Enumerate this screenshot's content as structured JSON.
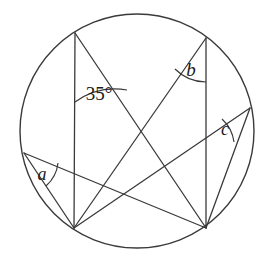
{
  "figure": {
    "type": "circle-geometry-diagram",
    "background_color": "#ffffff",
    "stroke_color": "#3a3a3a",
    "label_color": "#1a1a1a"
  },
  "circle": {
    "name": "main-circle",
    "center_x": 137,
    "center_y": 131,
    "radius": 117,
    "stroke_width": 1.4
  },
  "points": [
    {
      "id": "TL",
      "label": "top-left-vertex",
      "x": 75,
      "y": 33
    },
    {
      "id": "TR",
      "label": "top-right-vertex",
      "x": 206,
      "y": 38
    },
    {
      "id": "L",
      "label": "left-vertex",
      "x": 24,
      "y": 153
    },
    {
      "id": "R",
      "label": "right-vertex",
      "x": 250,
      "y": 108
    },
    {
      "id": "BL",
      "label": "bottom-left-vertex",
      "x": 74,
      "y": 228
    },
    {
      "id": "BR",
      "label": "bottom-right-vertex",
      "x": 206,
      "y": 228
    }
  ],
  "chords": [
    {
      "name": "chord-TL-BL",
      "from": "TL",
      "to": "BL"
    },
    {
      "name": "chord-TR-BR",
      "from": "TR",
      "to": "BR"
    },
    {
      "name": "chord-TL-BR",
      "from": "TL",
      "to": "BR"
    },
    {
      "name": "chord-TR-BL",
      "from": "TR",
      "to": "BL"
    },
    {
      "name": "chord-L-BR",
      "from": "L",
      "to": "BR"
    },
    {
      "name": "chord-L-BL",
      "from": "L",
      "to": "BL"
    },
    {
      "name": "chord-R-BL",
      "from": "R",
      "to": "BL"
    },
    {
      "name": "chord-R-BR",
      "from": "R",
      "to": "BR"
    }
  ],
  "angles": [
    {
      "id": "angle-35",
      "text": "35°",
      "value": 35,
      "unit": "degrees",
      "vertex": "TL",
      "label_x": 99,
      "label_y": 100,
      "font_size": 19,
      "arc_radius": 69,
      "arc_start_x": 75,
      "arc_start_y": 102,
      "arc_end_x": 127,
      "arc_end_y": 90
    },
    {
      "id": "angle-b",
      "text": "b",
      "vertex": "TR",
      "label_x": 191,
      "label_y": 76,
      "font_size": 19,
      "arc_radius": 44,
      "arc_start_x": 206,
      "arc_start_y": 82,
      "arc_end_x": 175,
      "arc_end_y": 69
    },
    {
      "id": "angle-c",
      "text": "c",
      "vertex": "R",
      "label_x": 225,
      "label_y": 135,
      "font_size": 18,
      "arc_radius": 38,
      "arc_start_x": 222,
      "arc_start_y": 119,
      "arc_end_x": 234,
      "arc_end_y": 142
    },
    {
      "id": "angle-a",
      "text": "a",
      "vertex": "L",
      "label_x": 42,
      "label_y": 180,
      "font_size": 18,
      "arc_radius": 36,
      "arc_start_x": 58,
      "arc_start_y": 163,
      "arc_end_x": 46,
      "arc_end_y": 186
    }
  ]
}
